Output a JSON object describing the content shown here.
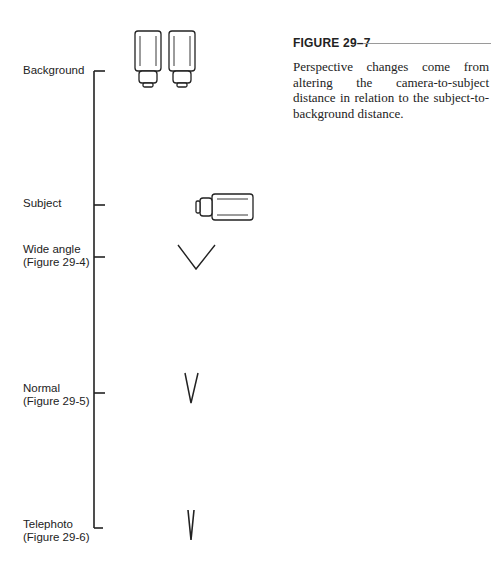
{
  "figure": {
    "title": "FIGURE 29–7",
    "caption": "Perspective changes come from altering the camera-to-subject distance in relation to the subject-to-background distance."
  },
  "scale": {
    "ticks": [
      {
        "id": "background",
        "label_lines": [
          "Background"
        ],
        "y": 71
      },
      {
        "id": "subject",
        "label_lines": [
          "Subject"
        ],
        "y": 205
      },
      {
        "id": "wide-angle",
        "label_lines": [
          "Wide angle",
          "(Figure 29-4)"
        ],
        "y": 257
      },
      {
        "id": "normal",
        "label_lines": [
          "Normal",
          "(Figure 29-5)"
        ],
        "y": 393
      },
      {
        "id": "telephoto",
        "label_lines": [
          "Telephoto",
          "(Figure 29-6)"
        ],
        "y": 528
      }
    ]
  },
  "elements": {
    "background_objects": [
      "bottle-1",
      "bottle-2"
    ],
    "subject_object": "camera",
    "viewing_angles": [
      {
        "id": "wide-angle",
        "shape": "wide-v"
      },
      {
        "id": "normal",
        "shape": "narrow-v"
      },
      {
        "id": "telephoto",
        "shape": "very-narrow-v"
      }
    ]
  }
}
